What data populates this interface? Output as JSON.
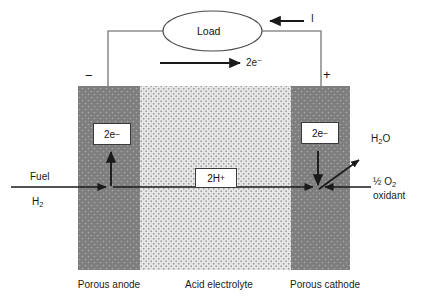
{
  "figure": {
    "title_alt": "Acid electrolyte fuel cell schematic",
    "background": "#ffffff",
    "electrode_color": "#7f7f7f",
    "electrolyte_color": "#e8e8e8",
    "line_color": "#222222",
    "wire_color": "#8c8c8c"
  },
  "circuit": {
    "load_label": "Load",
    "current_label": "I",
    "electron_flow_label": "2e",
    "electron_flow_sup": "−",
    "anode_sign": "−",
    "cathode_sign": "+"
  },
  "electrodes": {
    "anode": {
      "caption": "Porous anode",
      "electron_box": "2e",
      "electron_box_sup": "−"
    },
    "cathode": {
      "caption": "Porous cathode",
      "electron_box": "2e",
      "electron_box_sup": "−"
    }
  },
  "electrolyte": {
    "caption": "Acid electrolyte",
    "ion_box_text": "2H",
    "ion_box_sup": "+"
  },
  "reactants": {
    "fuel_label": "Fuel",
    "fuel_formula_base": "H",
    "fuel_formula_sub": "2",
    "oxidant_fraction": "½",
    "oxidant_formula_base": "O",
    "oxidant_formula_sub": "2",
    "oxidant_label": "oxidant"
  },
  "products": {
    "water_base_1": "H",
    "water_sub": "2",
    "water_base_2": "O"
  }
}
